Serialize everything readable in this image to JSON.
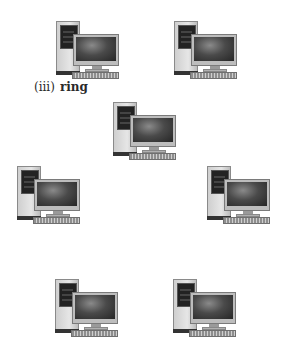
{
  "diagram": {
    "type": "network topology",
    "label": {
      "number": "(iii)",
      "name": "ring"
    },
    "nodes": [
      {
        "id": "computer-1",
        "icon": "desktop-computer-icon",
        "x": 56,
        "y": 21,
        "clipped": false
      },
      {
        "id": "computer-2",
        "icon": "desktop-computer-icon",
        "x": 174,
        "y": 21,
        "clipped": false
      },
      {
        "id": "computer-3",
        "icon": "desktop-computer-icon",
        "x": 113,
        "y": 102,
        "clipped": false
      },
      {
        "id": "computer-4",
        "icon": "desktop-computer-icon",
        "x": 17,
        "y": 166,
        "clipped": false
      },
      {
        "id": "computer-5",
        "icon": "desktop-computer-icon",
        "x": 207,
        "y": 166,
        "clipped": false
      },
      {
        "id": "computer-6",
        "icon": "desktop-computer-icon",
        "x": 55,
        "y": 279,
        "clipped": true
      },
      {
        "id": "computer-7",
        "icon": "desktop-computer-icon",
        "x": 173,
        "y": 279,
        "clipped": true
      }
    ]
  }
}
